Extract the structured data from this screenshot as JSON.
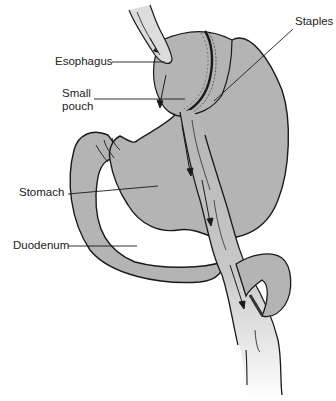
{
  "diagram": {
    "labels": {
      "esophagus": "Esophagus",
      "small_pouch_line1": "Small",
      "small_pouch_line2": "pouch",
      "staples": "Staples",
      "stomach": "Stomach",
      "duodenum": "Duodenum"
    },
    "colors": {
      "organ_fill": "#b4b4b4",
      "outline": "#1a1a1a",
      "background": "#ffffff",
      "label_text": "#222222"
    }
  }
}
